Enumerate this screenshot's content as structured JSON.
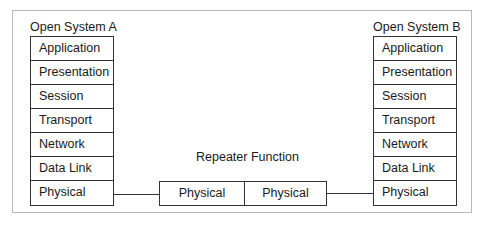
{
  "diagram": {
    "system_a": {
      "title": "Open System A",
      "layers": [
        "Application",
        "Presentation",
        "Session",
        "Transport",
        "Network",
        "Data Link",
        "Physical"
      ]
    },
    "system_b": {
      "title": "Open System B",
      "layers": [
        "Application",
        "Presentation",
        "Session",
        "Transport",
        "Network",
        "Data Link",
        "Physical"
      ]
    },
    "repeater": {
      "title": "Repeater Function",
      "boxes": [
        "Physical",
        "Physical"
      ]
    },
    "colors": {
      "line": "#333333",
      "frame": "#b8b8b8",
      "text": "#1a1a1a"
    }
  }
}
